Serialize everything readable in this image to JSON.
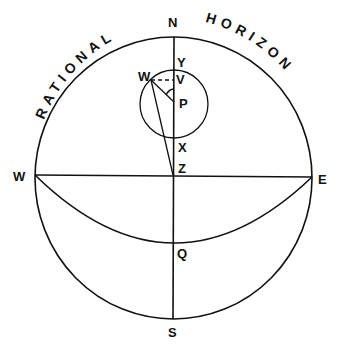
{
  "diagram": {
    "title_arc_left": "RATIONAL",
    "title_arc_right": "HORIZON",
    "labels": {
      "north": "N",
      "south": "S",
      "west": "W",
      "east": "E",
      "zenith": "Z",
      "pole": "P",
      "star": "W",
      "upper": "Y",
      "vertical_foot": "V",
      "lower": "X",
      "equator_point": "Q"
    },
    "colors": {
      "line": "#111111",
      "background": "#ffffff"
    }
  }
}
